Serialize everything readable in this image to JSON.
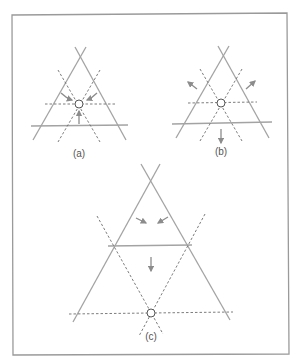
{
  "figure": {
    "frame": {
      "stroke": "#9a9a9a"
    },
    "colors": {
      "solid": "#a3a3a3",
      "dashed": "#6e6e6e",
      "arrow": "#8c8c8c",
      "circle": "#555555"
    },
    "panels": [
      {
        "id": "a",
        "label": "(a)",
        "description": "Three solid lines forming a triangle with dashed bisectors meeting at center point; arrows point inward toward the center"
      },
      {
        "id": "b",
        "label": "(b)",
        "description": "Same triangle configuration; arrows point outward away from the center"
      },
      {
        "id": "c",
        "label": "(c)",
        "description": "Larger triangle with a horizontal solid line; dashed lines meet at a point below; arrows point inward and downward"
      }
    ]
  }
}
